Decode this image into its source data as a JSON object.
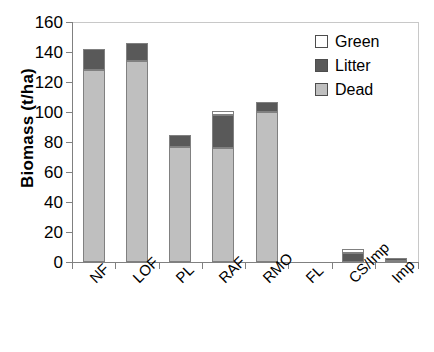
{
  "chart_data": {
    "type": "bar",
    "title": "",
    "xlabel": "",
    "ylabel": "Biomass (t/ha)",
    "ylim": [
      0,
      160
    ],
    "ytick_step": 20,
    "yticks": [
      "0",
      "20",
      "40",
      "60",
      "80",
      "100",
      "120",
      "140",
      "160"
    ],
    "grid": false,
    "stacked": true,
    "legend_position": "top-right",
    "categories": [
      "NF",
      "LOF",
      "PL",
      "RAF",
      "RMO",
      "FL",
      "CS/Imp",
      "Imp"
    ],
    "series": [
      {
        "name": "Dead",
        "color": "#bfbfbf",
        "values": [
          128,
          134,
          77,
          76,
          100,
          0,
          0,
          0.6
        ]
      },
      {
        "name": "Litter",
        "color": "#595959",
        "values": [
          14,
          12,
          8,
          22,
          7,
          0,
          6,
          1.2
        ]
      },
      {
        "name": "Green",
        "color": "#ffffff",
        "values": [
          0,
          0,
          0,
          3,
          0,
          0,
          3,
          0
        ]
      }
    ],
    "totals": [
      142,
      146,
      85,
      101,
      107,
      0,
      9,
      1.8
    ]
  },
  "legend": {
    "items": [
      {
        "label": "Green",
        "swatch": "green"
      },
      {
        "label": "Litter",
        "swatch": "litter"
      },
      {
        "label": "Dead",
        "swatch": "dead"
      }
    ]
  },
  "caption": {
    "text": ""
  }
}
